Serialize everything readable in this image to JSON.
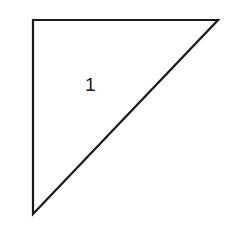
{
  "diagram": {
    "shape": "right-triangle",
    "vertices": [
      [
        33,
        20
      ],
      [
        218,
        20
      ],
      [
        33,
        214
      ]
    ],
    "stroke_color": "#1a1a1a",
    "fill_color": "#ffffff",
    "label": {
      "text": "1",
      "x": 85,
      "y": 91
    }
  }
}
